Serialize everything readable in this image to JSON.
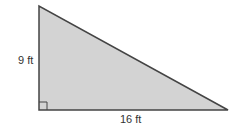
{
  "figure": {
    "type": "right-triangle",
    "fill_color": "#d3d3d3",
    "stroke_color": "#444444",
    "vertical_leg_label": "9 ft",
    "horizontal_leg_label": "16 ft",
    "right_angle_marker": true
  }
}
